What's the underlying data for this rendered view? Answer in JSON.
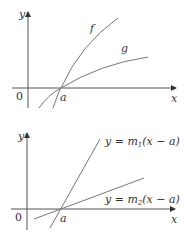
{
  "colors": {
    "axis": "#555555",
    "curve": "#777777",
    "text": "#333333",
    "background": "#ffffff"
  },
  "top_graph": {
    "y_axis_label": "y",
    "x_axis_label": "x",
    "origin_label": "0",
    "point_label": "a",
    "curves": [
      {
        "name": "f",
        "label": "f",
        "description": "steeper concave curve through (a, 0)"
      },
      {
        "name": "g",
        "label": "g",
        "description": "shallower concave curve through (a, 0)"
      }
    ]
  },
  "bottom_graph": {
    "y_axis_label": "y",
    "x_axis_label": "x",
    "origin_label": "0",
    "point_label": "a",
    "lines": [
      {
        "name": "line-m1",
        "label": "y = m₁(x − a)",
        "prefix": "y = m",
        "subscript": "1",
        "suffix": "(x − a)"
      },
      {
        "name": "line-m2",
        "label": "y = m₂(x − a)",
        "prefix": "y = m",
        "subscript": "2",
        "suffix": "(x − a)"
      }
    ]
  }
}
